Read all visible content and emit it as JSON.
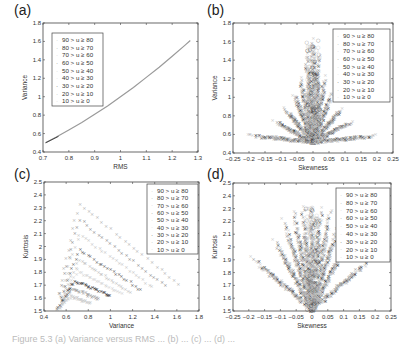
{
  "figure": {
    "caption": "Figure 5.3   (a) Variance versus RMS ... (b) ... (c) ... (d) ..."
  },
  "legend_entries": [
    "90 > u ≥ 80",
    "80 > u ≥ 70",
    "70 > u ≥ 60",
    "60 > u ≥ 50",
    "50 > u ≥ 40",
    "40 > u ≥ 30",
    "30 > u ≥ 20",
    "20 > u ≥ 10",
    "10 > u ≥ 0"
  ],
  "series_colors": [
    "#b0b0b0",
    "#8a8a8a",
    "#c4c4c4",
    "#5a5a5a",
    "#bdbdbd",
    "#d0d0d0",
    "#222222",
    "#9a9a9a",
    "#c8c8c8"
  ],
  "chart_data": [
    {
      "panel": "(a)",
      "type": "line",
      "title": "",
      "xlabel": "RMS",
      "ylabel": "Variance",
      "xlim": [
        0.7,
        1.3
      ],
      "ylim": [
        0.4,
        1.8
      ],
      "xticks": [
        "0.7",
        "0.8",
        "0.9",
        "1",
        "1.1",
        "1.2",
        "1.3"
      ],
      "yticks": [
        "0.4",
        "0.6",
        "0.8",
        "1",
        "1.2",
        "1.4",
        "1.6",
        "1.8"
      ],
      "legend_position": "upper left",
      "grid": false,
      "x": [
        0.71,
        0.75,
        0.8,
        0.85,
        0.9,
        0.95,
        1.0,
        1.05,
        1.1,
        1.15,
        1.2,
        1.25,
        1.27
      ],
      "y": [
        0.5,
        0.56,
        0.64,
        0.72,
        0.81,
        0.9,
        1.0,
        1.1,
        1.21,
        1.32,
        1.44,
        1.56,
        1.61
      ],
      "series": [
        {
          "name": "90 > u ≥ 80"
        },
        {
          "name": "80 > u ≥ 70"
        },
        {
          "name": "70 > u ≥ 60"
        },
        {
          "name": "60 > u ≥ 50"
        },
        {
          "name": "50 > u ≥ 40"
        },
        {
          "name": "40 > u ≥ 30"
        },
        {
          "name": "30 > u ≥ 20"
        },
        {
          "name": "20 > u ≥ 10"
        },
        {
          "name": "10 > u ≥ 0"
        }
      ]
    },
    {
      "panel": "(b)",
      "type": "scatter",
      "title": "",
      "xlabel": "Skewness",
      "ylabel": "Variance",
      "xlim": [
        -0.25,
        0.25
      ],
      "ylim": [
        0.4,
        1.8
      ],
      "xticks": [
        "-0.25",
        "-0.2",
        "-0.15",
        "-0.1",
        "-0.05",
        "0",
        "0.05",
        "0.1",
        "0.15",
        "0.2",
        "0.25"
      ],
      "yticks": [
        "0.4",
        "0.6",
        "0.8",
        "1",
        "1.2",
        "1.4",
        "1.6",
        "1.8"
      ],
      "legend_position": "upper right",
      "grid": false,
      "description": "Fan of rays from (0, ~0.5) spreading outward; center reaches ~1.6, outermost rays extend to skewness ±0.2 at variance ~0.57",
      "rays": [
        {
          "x_end": 0.0,
          "y_end": 1.61
        },
        {
          "x_end": 0.02,
          "y_end": 1.45
        },
        {
          "x_end": 0.04,
          "y_end": 1.2
        },
        {
          "x_end": 0.06,
          "y_end": 1.02
        },
        {
          "x_end": 0.09,
          "y_end": 0.86
        },
        {
          "x_end": 0.12,
          "y_end": 0.72
        },
        {
          "x_end": 0.2,
          "y_end": 0.57
        }
      ],
      "series": [
        {
          "name": "90 > u ≥ 80"
        },
        {
          "name": "80 > u ≥ 70"
        },
        {
          "name": "70 > u ≥ 60"
        },
        {
          "name": "60 > u ≥ 50"
        },
        {
          "name": "50 > u ≥ 40"
        },
        {
          "name": "40 > u ≥ 30"
        },
        {
          "name": "30 > u ≥ 20"
        },
        {
          "name": "20 > u ≥ 10"
        },
        {
          "name": "10 > u ≥ 0"
        }
      ]
    },
    {
      "panel": "(c)",
      "type": "scatter",
      "title": "",
      "xlabel": "Variance",
      "ylabel": "Kurtosis",
      "xlim": [
        0.4,
        1.8
      ],
      "ylim": [
        1.5,
        2.5
      ],
      "xticks": [
        "0.4",
        "0.6",
        "0.8",
        "1",
        "1.2",
        "1.4",
        "1.6",
        "1.8"
      ],
      "yticks": [
        "1.5",
        "1.6",
        "1.7",
        "1.8",
        "1.9",
        "2",
        "2.1",
        "2.2",
        "2.3",
        "2.4",
        "2.5"
      ],
      "legend_position": "upper right",
      "grid": false,
      "description": "Family of arch-shaped curves rising steeply from (~0.5, 1.5) to peaks near variance 0.7–0.9, then declining toward variance up to ~1.62 at kurtosis ~1.69",
      "curves": [
        {
          "peak": [
            0.72,
            2.32
          ],
          "end": [
            1.62,
            1.69
          ]
        },
        {
          "peak": [
            0.72,
            2.2
          ],
          "end": [
            1.5,
            1.68
          ]
        },
        {
          "peak": [
            0.72,
            2.08
          ],
          "end": [
            1.38,
            1.67
          ]
        },
        {
          "peak": [
            0.72,
            1.96
          ],
          "end": [
            1.28,
            1.65
          ]
        },
        {
          "peak": [
            0.72,
            1.88
          ],
          "end": [
            1.18,
            1.63
          ]
        },
        {
          "peak": [
            0.7,
            1.8
          ],
          "end": [
            1.1,
            1.62
          ]
        },
        {
          "peak": [
            0.68,
            1.72
          ],
          "end": [
            1.0,
            1.6
          ]
        },
        {
          "peak": [
            0.66,
            1.66
          ],
          "end": [
            0.9,
            1.58
          ]
        },
        {
          "peak": [
            0.64,
            1.6
          ],
          "end": [
            0.82,
            1.55
          ]
        }
      ],
      "series": [
        {
          "name": "90 > u ≥ 80"
        },
        {
          "name": "80 > u ≥ 70"
        },
        {
          "name": "70 > u ≥ 60"
        },
        {
          "name": "60 > u ≥ 50"
        },
        {
          "name": "50 > u ≥ 40"
        },
        {
          "name": "40 > u ≥ 30"
        },
        {
          "name": "30 > u ≥ 20"
        },
        {
          "name": "20 > u ≥ 10"
        },
        {
          "name": "10 > u ≥ 0"
        }
      ]
    },
    {
      "panel": "(d)",
      "type": "scatter",
      "title": "",
      "xlabel": "Skewness",
      "ylabel": "Kurtosis",
      "xlim": [
        -0.25,
        0.25
      ],
      "ylim": [
        1.5,
        2.5
      ],
      "xticks": [
        "-0.25",
        "-0.2",
        "-0.15",
        "-0.1",
        "-0.05",
        "0",
        "0.05",
        "0.1",
        "0.15",
        "0.2",
        "0.25"
      ],
      "yticks": [
        "1.5",
        "1.6",
        "1.7",
        "1.8",
        "1.9",
        "2",
        "2.1",
        "2.2",
        "2.3",
        "2.4",
        "2.5"
      ],
      "legend_position": "upper right",
      "grid": false,
      "description": "V-shaped fan of rays from (0, 1.5) spreading outward to kurtosis ~2.3 near center and to skewness ±0.19 at kurtosis ~1.9 on the outermost rays",
      "rays": [
        {
          "x_end": 0.0,
          "y_end": 2.3
        },
        {
          "x_end": 0.03,
          "y_end": 2.3
        },
        {
          "x_end": 0.06,
          "y_end": 2.28
        },
        {
          "x_end": 0.09,
          "y_end": 2.2
        },
        {
          "x_end": 0.12,
          "y_end": 2.05
        },
        {
          "x_end": 0.19,
          "y_end": 1.9
        }
      ],
      "series": [
        {
          "name": "90 > u ≥ 80"
        },
        {
          "name": "80 > u ≥ 70"
        },
        {
          "name": "70 > u ≥ 60"
        },
        {
          "name": "60 > u ≥ 50"
        },
        {
          "name": "50 > u ≥ 40"
        },
        {
          "name": "40 > u ≥ 30"
        },
        {
          "name": "30 > u ≥ 20"
        },
        {
          "name": "20 > u ≥ 10"
        },
        {
          "name": "10 > u ≥ 0"
        }
      ]
    }
  ]
}
